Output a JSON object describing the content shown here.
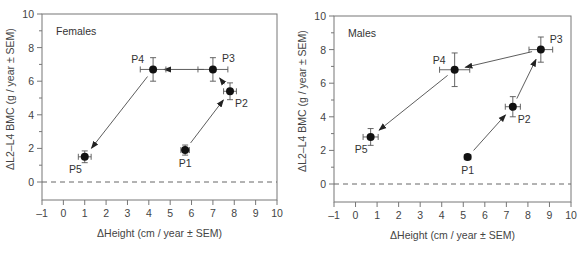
{
  "chart_data": [
    {
      "type": "scatter",
      "title": "Females",
      "xlabel": "ΔHeight (cm / year ± SEM)",
      "ylabel": "ΔL2–L4 BMC (g / year ± SEM)",
      "xlim": [
        -1,
        10
      ],
      "ylim": [
        -1,
        10
      ],
      "xticks": [
        -1,
        0,
        1,
        2,
        3,
        4,
        5,
        6,
        7,
        8,
        9,
        10
      ],
      "yticks": [
        0,
        2,
        4,
        6,
        8,
        10
      ],
      "reference_line": {
        "y": 0,
        "style": "dashed"
      },
      "points": [
        {
          "label": "P1",
          "x": 5.7,
          "y": 1.9,
          "xerr": 0.2,
          "yerr": 0.3,
          "label_pos": "below"
        },
        {
          "label": "P2",
          "x": 7.8,
          "y": 5.4,
          "xerr": 0.3,
          "yerr": 0.5,
          "label_pos": "below-right"
        },
        {
          "label": "P3",
          "x": 7.0,
          "y": 6.7,
          "xerr": 0.7,
          "yerr": 0.7,
          "label_pos": "above-right"
        },
        {
          "label": "P4",
          "x": 4.2,
          "y": 6.7,
          "xerr": 0.6,
          "yerr": 0.7,
          "label_pos": "above-left"
        },
        {
          "label": "P5",
          "x": 1.0,
          "y": 1.5,
          "xerr": 0.3,
          "yerr": 0.35,
          "label_pos": "below-left"
        }
      ],
      "arrows": [
        [
          "P1",
          "P2"
        ],
        [
          "P2",
          "P3"
        ],
        [
          "P3",
          "P4"
        ],
        [
          "P4",
          "P5"
        ]
      ]
    },
    {
      "type": "scatter",
      "title": "Males",
      "xlabel": "ΔHeight (cm / year ± SEM)",
      "ylabel": "ΔL2–L4 BMC (g / year ± SEM)",
      "xlim": [
        -1,
        10
      ],
      "ylim": [
        -1,
        10
      ],
      "xticks": [
        -1,
        0,
        1,
        2,
        3,
        4,
        5,
        6,
        7,
        8,
        9,
        10
      ],
      "yticks": [
        0,
        2,
        4,
        6,
        8,
        10
      ],
      "reference_line": {
        "y": 0,
        "style": "dashed"
      },
      "points": [
        {
          "label": "P1",
          "x": 5.2,
          "y": 1.6,
          "xerr": 0.15,
          "yerr": 0.15,
          "label_pos": "below"
        },
        {
          "label": "P2",
          "x": 7.3,
          "y": 4.6,
          "xerr": 0.35,
          "yerr": 0.6,
          "label_pos": "below-right"
        },
        {
          "label": "P3",
          "x": 8.6,
          "y": 8.0,
          "xerr": 0.55,
          "yerr": 0.75,
          "label_pos": "above-right"
        },
        {
          "label": "P4",
          "x": 4.6,
          "y": 6.8,
          "xerr": 0.7,
          "yerr": 1.0,
          "label_pos": "above-left"
        },
        {
          "label": "P5",
          "x": 0.7,
          "y": 2.8,
          "xerr": 0.35,
          "yerr": 0.5,
          "label_pos": "below-left"
        }
      ],
      "arrows": [
        [
          "P1",
          "P2"
        ],
        [
          "P2",
          "P3"
        ],
        [
          "P3",
          "P4"
        ],
        [
          "P4",
          "P5"
        ]
      ]
    }
  ]
}
